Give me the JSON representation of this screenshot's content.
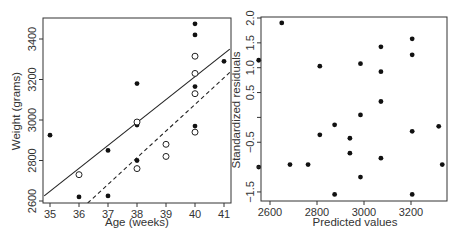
{
  "chart_data": [
    {
      "type": "scatter",
      "panel": "left",
      "title": "",
      "xlabel": "Age (weeks)",
      "ylabel": "Weight (grams)",
      "xlim": [
        34.8,
        41.2
      ],
      "ylim": [
        2590,
        3500
      ],
      "xticks": [
        35,
        36,
        37,
        38,
        39,
        40,
        41
      ],
      "yticks": [
        2600,
        2800,
        3000,
        3200,
        3400
      ],
      "grid": false,
      "legend": null,
      "series": [
        {
          "name": "filled",
          "marker": "filled-circle",
          "points": [
            [
              35,
              2925
            ],
            [
              36,
              2620
            ],
            [
              37,
              2850
            ],
            [
              37,
              2625
            ],
            [
              38,
              3180
            ],
            [
              38,
              2975
            ],
            [
              38,
              2800
            ],
            [
              40,
              3475
            ],
            [
              40,
              3420
            ],
            [
              40,
              3165
            ],
            [
              40,
              2970
            ],
            [
              41,
              3290
            ]
          ]
        },
        {
          "name": "open",
          "marker": "open-circle",
          "points": [
            [
              36,
              2730
            ],
            [
              38,
              2990
            ],
            [
              38,
              2760
            ],
            [
              39,
              2880
            ],
            [
              39,
              2820
            ],
            [
              40,
              3315
            ],
            [
              40,
              3230
            ],
            [
              40,
              3130
            ],
            [
              40,
              2940
            ]
          ]
        }
      ],
      "lines": [
        {
          "name": "fit-filled",
          "style": "solid",
          "from": [
            34.8,
            2625
          ],
          "to": [
            41.2,
            3350
          ]
        },
        {
          "name": "fit-open",
          "style": "dashed",
          "from": [
            36.3,
            2590
          ],
          "to": [
            41.2,
            3235
          ]
        }
      ]
    },
    {
      "type": "scatter",
      "panel": "right",
      "title": "",
      "xlabel": "Predicted values",
      "ylabel": "Standardized residuals",
      "xlim": [
        2540,
        3345
      ],
      "ylim": [
        -1.6,
        2.0
      ],
      "xticks": [
        2600,
        2800,
        3000,
        3200
      ],
      "yticks": [
        -1.5,
        -1.0,
        -0.5,
        0.0,
        0.5,
        1.0,
        1.5,
        2.0
      ],
      "ytick_labels": [
        "−1.5",
        "",
        "−0.5",
        "",
        "0.5",
        "1.0",
        "1.5",
        "2.0"
      ],
      "grid": false,
      "legend": null,
      "series": [
        {
          "name": "residuals",
          "marker": "filled-circle",
          "points": [
            [
              2552,
              1.15
            ],
            [
              2552,
              -1.0
            ],
            [
              2650,
              1.9
            ],
            [
              2685,
              -0.95
            ],
            [
              2762,
              -0.95
            ],
            [
              2812,
              1.03
            ],
            [
              2812,
              -0.35
            ],
            [
              2875,
              -0.15
            ],
            [
              2875,
              -1.55
            ],
            [
              2940,
              -0.42
            ],
            [
              2940,
              -0.72
            ],
            [
              2985,
              1.08
            ],
            [
              2985,
              0.05
            ],
            [
              2985,
              -1.2
            ],
            [
              3072,
              1.42
            ],
            [
              3072,
              0.92
            ],
            [
              3072,
              0.32
            ],
            [
              3072,
              -0.82
            ],
            [
              3205,
              1.58
            ],
            [
              3205,
              1.26
            ],
            [
              3205,
              -0.28
            ],
            [
              3205,
              -1.55
            ],
            [
              3318,
              -0.18
            ],
            [
              3333,
              -0.95
            ]
          ]
        }
      ]
    }
  ]
}
